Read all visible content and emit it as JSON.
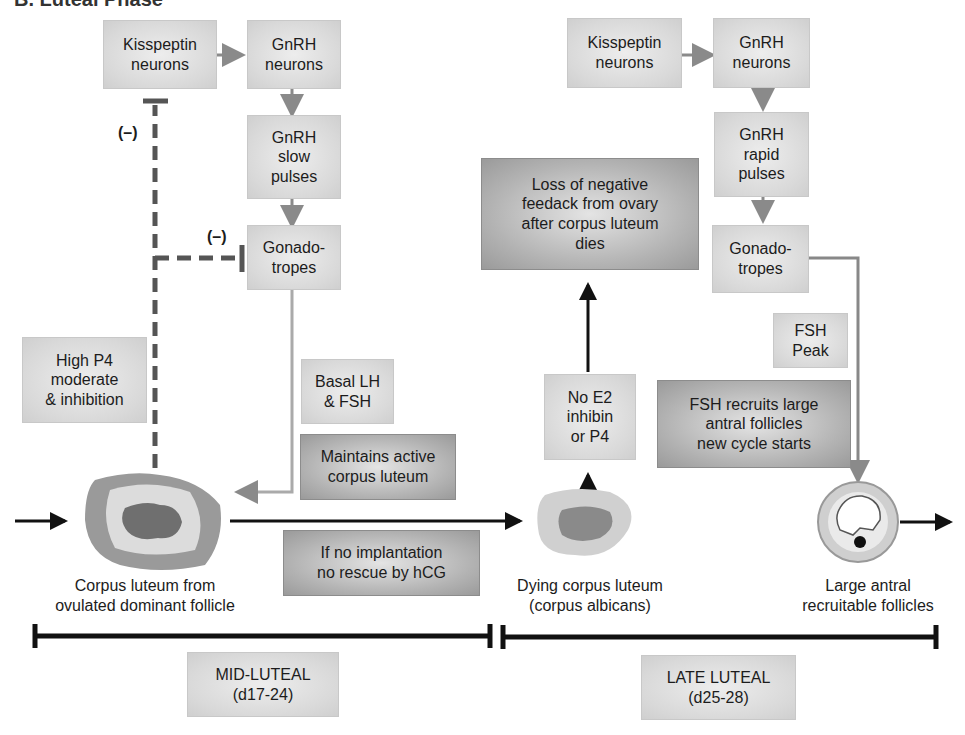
{
  "title": "B. Luteal Phase",
  "mid_luteal": {
    "kisspeptin": "Kisspeptin\nneurons",
    "gnrh_neurons": "GnRH\nneurons",
    "gnrh_pulses": "GnRH\nslow\npulses",
    "gonadotropes": "Gonado-\ntropes",
    "negative_feedback_1": "(–)",
    "negative_feedback_2": "(–)",
    "high_p4": "High P4\nmoderate\n& inhibition",
    "basal_lh_fsh": "Basal LH\n& FSH",
    "maintains": "Maintains active\ncorpus luteum",
    "no_implantation": "If no implantation\nno rescue by hCG",
    "corpus_luteum_label": "Corpus luteum from\novulated dominant follicle",
    "phase_label": "MID-LUTEAL\n(d17-24)"
  },
  "late_luteal": {
    "kisspeptin": "Kisspeptin\nneurons",
    "gnrh_neurons": "GnRH\nneurons",
    "gnrh_pulses": "GnRH\nrapid\npulses",
    "gonadotropes": "Gonado-\ntropes",
    "loss_feedback": "Loss of negative\nfeedack from ovary\nafter corpus luteum\ndies",
    "no_e2": "No E2\ninhibin\nor P4",
    "fsh_peak": "FSH\nPeak",
    "fsh_recruits": "FSH recruits large\nantral follicles\nnew cycle starts",
    "dying_cl_label": "Dying corpus luteum\n(corpus albicans)",
    "antral_label": "Large antral\nrecruitable follicles",
    "phase_label": "LATE LUTEAL\n(d25-28)"
  }
}
